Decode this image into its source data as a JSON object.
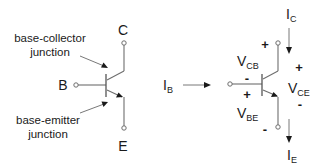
{
  "left_symbol": {
    "terminals": {
      "collector": "C",
      "base": "B",
      "emitter": "E"
    },
    "annotations": {
      "base_collector": [
        "base-collector",
        "junction"
      ],
      "base_emitter": [
        "base-emitter",
        "junction"
      ]
    }
  },
  "right_symbol": {
    "currents": {
      "base": {
        "main": "I",
        "sub": "B"
      },
      "collector": {
        "main": "I",
        "sub": "C"
      },
      "emitter": {
        "main": "I",
        "sub": "E"
      }
    },
    "voltages": {
      "vcb": {
        "main": "V",
        "sub": "CB",
        "plus": "+",
        "minus": "-"
      },
      "vbe": {
        "main": "V",
        "sub": "BE",
        "plus": "+",
        "minus": "-"
      },
      "vce": {
        "main": "V",
        "sub": "CE",
        "plus": "+",
        "minus": "-"
      }
    }
  },
  "colors": {
    "wire": "#6e6e6e",
    "text": "#1a1a1a",
    "background": "#ffffff"
  }
}
